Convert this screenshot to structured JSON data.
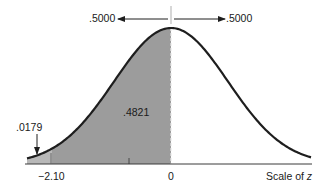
{
  "chart_data": {
    "type": "area",
    "title": "",
    "xlabel": "Scale of z",
    "ylabel": "",
    "distribution": "standard normal",
    "x_ticks": [
      {
        "value": -2.1,
        "label": "−2.10"
      },
      {
        "value": 0,
        "label": "0"
      }
    ],
    "minor_tick_z": -0.75,
    "shaded_regions": [
      {
        "from": "-inf",
        "to": -2.1,
        "area": 0.0179,
        "label": ".0179",
        "color": "#b8b8b8"
      },
      {
        "from": -2.1,
        "to": 0,
        "area": 0.4821,
        "label": ".4821",
        "color": "#9c9c9c"
      }
    ],
    "half_areas": [
      {
        "side": "left",
        "area": 0.5,
        "label": ".5000"
      },
      {
        "side": "right",
        "area": 0.5,
        "label": ".5000"
      }
    ],
    "grid": false,
    "legend": null
  },
  "labels": {
    "left_half": ".5000",
    "right_half": ".5000",
    "tail_area": ".0179",
    "middle_area": ".4821",
    "tick_neg": "−2.10",
    "tick_zero": "0",
    "axis_title": "Scale of z"
  },
  "colors": {
    "curve": "#1e1e1e",
    "shade_main": "#9c9c9c",
    "shade_tail": "#b8b8b8",
    "axis": "#3a3a3a"
  }
}
